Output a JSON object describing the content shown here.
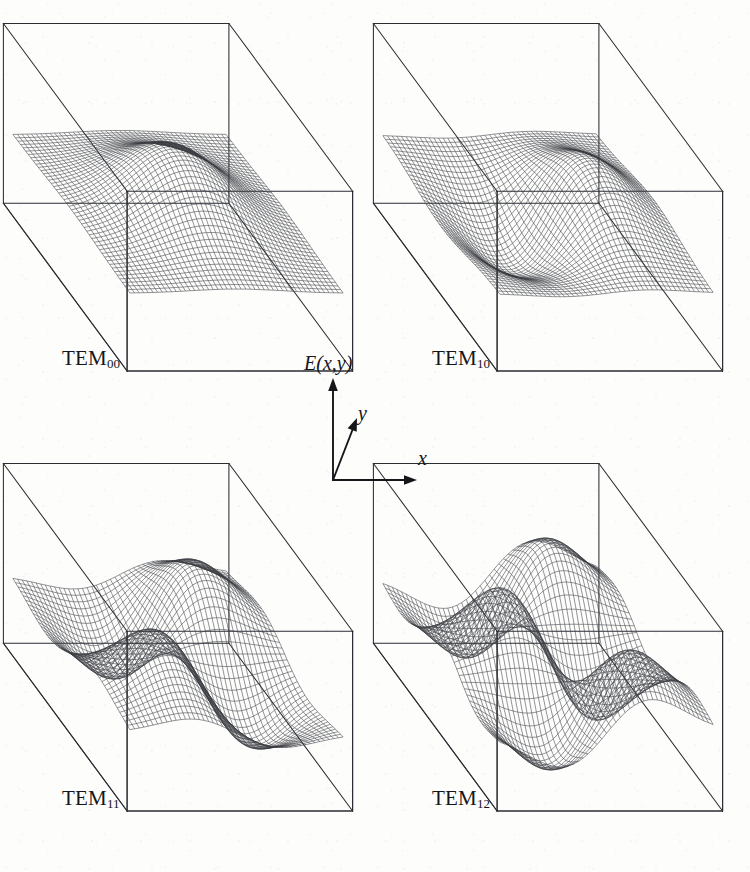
{
  "figure": {
    "background_color": "#fdfdfc",
    "ink_color": "#2b2d33",
    "panel_count": 4
  },
  "axis_key": {
    "vertical_label": "E(x,y)",
    "depth_label": "y",
    "horizontal_label": "x",
    "vertical_icon": "up-arrow-icon",
    "depth_icon": "diagonal-arrow-icon",
    "horizontal_icon": "right-arrow-icon"
  },
  "panels": [
    {
      "id": "tem00",
      "label_prefix": "TEM",
      "label_sub": "00",
      "m": 0,
      "n": 0,
      "lobes_x": 1,
      "lobes_y": 1,
      "description": "Single central Gaussian peak, fundamental mode",
      "origin": {
        "x": 28,
        "y": 28
      },
      "size": {
        "w": 300,
        "h": 360
      }
    },
    {
      "id": "tem10",
      "label_prefix": "TEM",
      "label_sub": "10",
      "m": 1,
      "n": 0,
      "lobes_x": 2,
      "lobes_y": 1,
      "description": "Two lobes along x with opposite sign",
      "origin": {
        "x": 398,
        "y": 28
      },
      "size": {
        "w": 300,
        "h": 360
      }
    },
    {
      "id": "tem11",
      "label_prefix": "TEM",
      "label_sub": "11",
      "m": 1,
      "n": 1,
      "lobes_x": 2,
      "lobes_y": 2,
      "description": "Two by two lobe pattern with alternating sign",
      "origin": {
        "x": 28,
        "y": 468
      },
      "size": {
        "w": 300,
        "h": 360
      }
    },
    {
      "id": "tem12",
      "label_prefix": "TEM",
      "label_sub": "12",
      "m": 1,
      "n": 2,
      "lobes_x": 2,
      "lobes_y": 3,
      "description": "Two by three lobe pattern with alternating sign",
      "origin": {
        "x": 398,
        "y": 468
      },
      "size": {
        "w": 300,
        "h": 360
      }
    }
  ],
  "chart_data": {
    "type": "surface",
    "xlabel": "x",
    "ylabel": "y",
    "zlabel": "E(x,y)",
    "grid": false,
    "legend": "none",
    "projection": "oblique-3d-box",
    "mesh_divisions": 46,
    "domain": {
      "x": [
        -2.6,
        2.6
      ],
      "y": [
        -2.6,
        2.6
      ]
    },
    "formula": "E(x,y) = H_m(x) * H_n(y) * exp(-(x^2+y^2))",
    "series": [
      {
        "name": "TEM00",
        "m": 0,
        "n": 0,
        "peaks": 1,
        "troughs": 0,
        "max_amplitude": 1.0,
        "min_amplitude": 0.0
      },
      {
        "name": "TEM10",
        "m": 1,
        "n": 0,
        "peaks": 1,
        "troughs": 1,
        "max_amplitude": 1.0,
        "min_amplitude": -1.0
      },
      {
        "name": "TEM11",
        "m": 1,
        "n": 1,
        "peaks": 2,
        "troughs": 2,
        "max_amplitude": 1.0,
        "min_amplitude": -1.0
      },
      {
        "name": "TEM12",
        "m": 1,
        "n": 2,
        "peaks": 3,
        "troughs": 3,
        "max_amplitude": 1.0,
        "min_amplitude": -1.0
      }
    ]
  }
}
